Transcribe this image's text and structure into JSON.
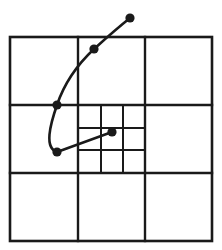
{
  "diagram": {
    "type": "adaptive quadtree-like grid with trajectory curve",
    "colors": {
      "line": "#1a1a1a",
      "background": "#ffffff"
    },
    "outer_square": {
      "x1": 10,
      "y1": 37,
      "x2": 212,
      "y2": 241
    },
    "major_grid": {
      "vertical": [
        78,
        145
      ],
      "horizontal": [
        105,
        173
      ]
    },
    "refined_cell": {
      "x1": 78,
      "y1": 105,
      "x2": 145,
      "y2": 173,
      "vertical": [
        101,
        123
      ],
      "horizontal": [
        128,
        150
      ]
    },
    "points": [
      {
        "name": "point-1",
        "x": 130,
        "y": 18
      },
      {
        "name": "point-2",
        "x": 94,
        "y": 49
      },
      {
        "name": "point-3",
        "x": 57,
        "y": 105
      },
      {
        "name": "point-4",
        "x": 57,
        "y": 152
      },
      {
        "name": "point-5",
        "x": 112,
        "y": 132
      }
    ],
    "curve_path": "M130,18 C115,30 104,40 94,49 C78,64 64,84 57,105 C50,125 44,148 57,152 L112,132"
  }
}
